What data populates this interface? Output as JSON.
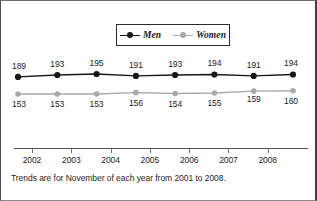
{
  "chart_data": {
    "type": "line",
    "title": "",
    "subtitle": "",
    "xlabel": "",
    "ylabel": "",
    "grid": false,
    "legend_position": "top-center",
    "categories": [
      "2001",
      "2002",
      "2003",
      "2004",
      "2005",
      "2006",
      "2007",
      "2008"
    ],
    "x_tick_labels": [
      "2002",
      "2003",
      "2004",
      "2005",
      "2006",
      "2007",
      "2008"
    ],
    "series": [
      {
        "name": "Men",
        "color": "#16161a",
        "marker": "circle-filled",
        "label_position": "above",
        "values": [
          189,
          193,
          195,
          191,
          193,
          194,
          191,
          194
        ]
      },
      {
        "name": "Women",
        "color": "#a8a8ad",
        "marker": "circle-filled",
        "label_position": "below",
        "values": [
          153,
          153,
          153,
          156,
          154,
          155,
          159,
          160
        ]
      }
    ],
    "ylim": [
      145,
      200
    ],
    "annotation": "Trends are for November of each year from 2001 to 2008."
  },
  "legend": {
    "entries": [
      {
        "label": "Men"
      },
      {
        "label": "Women"
      }
    ]
  },
  "caption": {
    "text": "Trends are for November of each year from 2001 to 2008."
  },
  "source_note": {
    "text": ""
  },
  "colors": {
    "men": "#16161a",
    "women": "#a8a8ad",
    "axis": "#4d4d52",
    "text": "#1b1b1e",
    "background": "#ffffff"
  }
}
